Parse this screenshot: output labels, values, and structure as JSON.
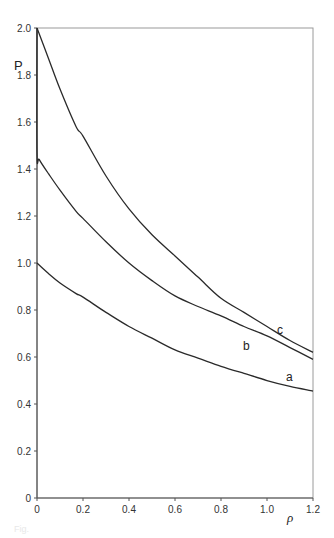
{
  "chart_data": {
    "type": "line",
    "title": "",
    "xlabel": "ρ",
    "ylabel": "P",
    "xlim": [
      0,
      1.2
    ],
    "ylim": [
      0,
      2.0
    ],
    "grid": false,
    "legend": "inline labels at right end of curves",
    "x_ticks": [
      "0",
      "0.2",
      "0.4",
      "0.6",
      "0.8",
      "1.0",
      "1.2"
    ],
    "y_ticks": [
      "0",
      "0.2",
      "0.4",
      "0.6",
      "0.8",
      "1.0",
      "1.2",
      "1.4",
      "1.6",
      "1.8",
      "2.0"
    ],
    "series": [
      {
        "name": "a",
        "x": [
          0,
          0.05,
          0.1,
          0.17,
          0.2,
          0.3,
          0.4,
          0.5,
          0.6,
          0.7,
          0.8,
          0.9,
          1.0,
          1.1,
          1.2
        ],
        "y": [
          1.0,
          0.955,
          0.915,
          0.87,
          0.855,
          0.79,
          0.73,
          0.68,
          0.63,
          0.595,
          0.56,
          0.53,
          0.5,
          0.475,
          0.455
        ]
      },
      {
        "name": "b",
        "x": [
          0,
          0.0,
          0.01,
          0.05,
          0.1,
          0.17,
          0.2,
          0.3,
          0.4,
          0.5,
          0.6,
          0.7,
          0.8,
          0.9,
          1.0,
          1.1,
          1.2
        ],
        "y": [
          2.0,
          1.47,
          1.44,
          1.38,
          1.31,
          1.22,
          1.19,
          1.09,
          1.0,
          0.925,
          0.86,
          0.815,
          0.775,
          0.73,
          0.69,
          0.64,
          0.59
        ]
      },
      {
        "name": "c",
        "x": [
          0,
          0.05,
          0.1,
          0.17,
          0.2,
          0.3,
          0.4,
          0.5,
          0.6,
          0.7,
          0.8,
          0.9,
          1.0,
          1.1,
          1.2
        ],
        "y": [
          2.0,
          1.87,
          1.74,
          1.58,
          1.54,
          1.37,
          1.23,
          1.12,
          1.03,
          0.94,
          0.85,
          0.79,
          0.73,
          0.67,
          0.62
        ]
      }
    ]
  },
  "labels": {
    "y_axis": "P",
    "x_axis": "ρ",
    "curve_a": "a",
    "curve_b": "b",
    "curve_c": "c"
  },
  "caption": "Fig."
}
